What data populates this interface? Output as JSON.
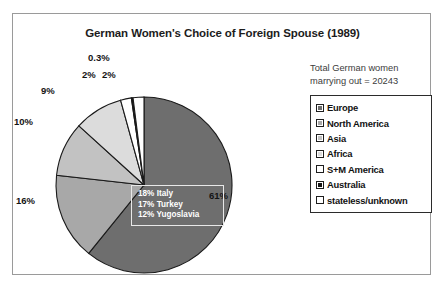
{
  "chart_data": {
    "type": "pie",
    "title": "German Women's Choice of Foreign Spouse (1989)",
    "categories": [
      "Europe",
      "North America",
      "Asia",
      "Africa",
      "S+M America",
      "Australia",
      "stateless/unknown"
    ],
    "values": [
      61,
      16,
      10,
      9,
      2,
      0.3,
      2
    ],
    "value_labels": [
      "61%",
      "16%",
      "10%",
      "9%",
      "2%",
      "0.3%",
      "2%"
    ],
    "colors": [
      "#6e6e6e",
      "#a8a8a8",
      "#c2c2c2",
      "#dcdcdc",
      "#ffffff",
      "#151515",
      "#ffffff"
    ],
    "legend_position": "right",
    "grid": false,
    "annotations": {
      "total_note_line1": "Total German women",
      "total_note_line2": "marrying out = 20243",
      "total_value": "20243",
      "breakdown_title": "",
      "breakdown": [
        "18% Italy",
        "17% Turkey",
        "12% Yugoslavia"
      ]
    }
  },
  "chart": {
    "title": "German Women's Choice of Foreign Spouse (1989)",
    "labels": {
      "europe": "61%",
      "north_america": "16%",
      "asia": "10%",
      "africa": "9%",
      "s_m_america": "2%",
      "stateless": "2%",
      "australia": "0.3%"
    },
    "callout": {
      "line1": "18% Italy",
      "line2": "17% Turkey",
      "line3": "12% Yugoslavia"
    }
  },
  "side_panel": {
    "note_line1": "Total German women",
    "note_line2": "marrying out = 20243",
    "legend": [
      {
        "label": "Europe",
        "color": "#6e6e6e"
      },
      {
        "label": "North America",
        "color": "#a8a8a8"
      },
      {
        "label": "Asia",
        "color": "#c2c2c2"
      },
      {
        "label": "Africa",
        "color": "#dcdcdc"
      },
      {
        "label": "S+M America",
        "color": "#ffffff"
      },
      {
        "label": "Australia",
        "color": "#151515"
      },
      {
        "label": "stateless/unknown",
        "color": "#ffffff"
      }
    ]
  }
}
